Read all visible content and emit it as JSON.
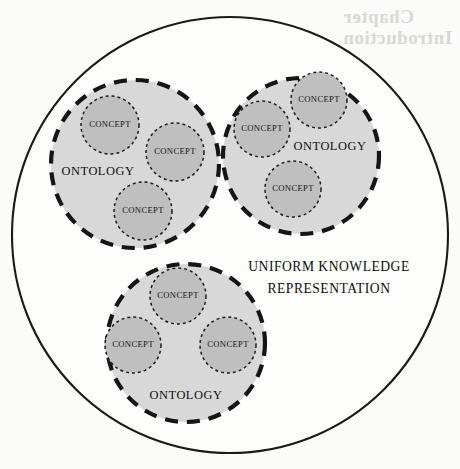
{
  "figure": {
    "kind": "venn-style-containment-diagram",
    "background_color": "#fbfbf9",
    "bleed_through_text_line1": "Chapter",
    "bleed_through_text_line2": "Introduction"
  },
  "universe": {
    "label_line1": "UNIFORM KNOWLEDGE",
    "label_line2": "REPRESENTATION",
    "stroke_color": "#1a1a1a",
    "fill_color": "#fdfdfb",
    "cx": 230,
    "cy": 235,
    "r": 218
  },
  "ontologies": [
    {
      "id": "ontology-top-left",
      "label": "ONTOLOGY",
      "cx": 135,
      "cy": 164,
      "r": 84,
      "label_x": 98,
      "label_y": 172,
      "fill_color": "#d5d5d5",
      "stroke_color": "#151515",
      "concepts": [
        {
          "id": "concept-tl-1",
          "label": "CONCEPT",
          "cx": 110,
          "cy": 125,
          "r": 29
        },
        {
          "id": "concept-tl-2",
          "label": "CONCEPT",
          "cx": 175,
          "cy": 152,
          "r": 29
        },
        {
          "id": "concept-tl-3",
          "label": "CONCEPT",
          "cx": 143,
          "cy": 211,
          "r": 29
        }
      ]
    },
    {
      "id": "ontology-top-right",
      "label": "ONTOLOGY",
      "cx": 301,
      "cy": 156,
      "r": 78,
      "label_x": 330,
      "label_y": 147,
      "fill_color": "#d5d5d5",
      "stroke_color": "#151515",
      "concepts": [
        {
          "id": "concept-tr-1",
          "label": "CONCEPT",
          "cx": 319,
          "cy": 100,
          "r": 28
        },
        {
          "id": "concept-tr-2",
          "label": "CONCEPT",
          "cx": 262,
          "cy": 129,
          "r": 28
        },
        {
          "id": "concept-tr-3",
          "label": "CONCEPT",
          "cx": 293,
          "cy": 189,
          "r": 28
        }
      ]
    },
    {
      "id": "ontology-bottom",
      "label": "ONTOLOGY",
      "cx": 186,
      "cy": 343,
      "r": 79,
      "label_x": 186,
      "label_y": 396,
      "fill_color": "#d5d5d5",
      "stroke_color": "#151515",
      "concepts": [
        {
          "id": "concept-b-1",
          "label": "CONCEPT",
          "cx": 178,
          "cy": 296,
          "r": 28
        },
        {
          "id": "concept-b-2",
          "label": "CONCEPT",
          "cx": 133,
          "cy": 345,
          "r": 28
        },
        {
          "id": "concept-b-3",
          "label": "CONCEPT",
          "cx": 228,
          "cy": 345,
          "r": 28
        }
      ]
    }
  ],
  "universe_label_position": {
    "x": 329,
    "y_line1": 268,
    "y_line2": 290
  }
}
